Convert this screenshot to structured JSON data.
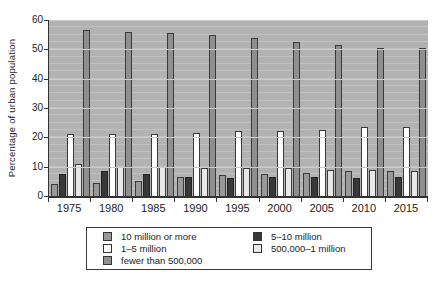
{
  "chart_data": {
    "type": "bar",
    "title": "",
    "xlabel": "",
    "ylabel": "Percentage of urban population",
    "ylim": [
      0,
      60
    ],
    "yticks": [
      0,
      10,
      20,
      30,
      40,
      50,
      60
    ],
    "grid": "horizontal, major every 10, faint minor stripes every 2.5",
    "plot_background": "#b2b2b2",
    "gridline_color": "#cbcbcb",
    "legend_position": "boxed, below chart, two columns",
    "categories": [
      "1975",
      "1980",
      "1985",
      "1990",
      "1995",
      "2000",
      "2005",
      "2010",
      "2015"
    ],
    "series": [
      {
        "name": "10 million or more",
        "color": "#999999",
        "border": "#3a3a3a",
        "values": [
          4,
          4.5,
          5,
          6.5,
          7,
          7.5,
          8,
          8.5,
          8.5
        ]
      },
      {
        "name": "5–10 million",
        "color": "#383838",
        "border": "#222222",
        "values": [
          7.5,
          8.5,
          7.5,
          6.5,
          6,
          6.5,
          6.5,
          6,
          6.5
        ]
      },
      {
        "name": "1–5 million",
        "color": "#ffffff",
        "border": "#3a3a3a",
        "values": [
          21,
          21,
          21,
          21.5,
          22,
          22,
          22.5,
          23.5,
          23.5
        ]
      },
      {
        "name": "500,000–1 million",
        "color": "#e8e8e8",
        "border": "#3a3a3a",
        "values": [
          11,
          10,
          10,
          9.5,
          9.5,
          9.5,
          9,
          9,
          8.5
        ]
      },
      {
        "name": "fewer than 500,000",
        "color": "#8f8f8f",
        "border": "#3a3a3a",
        "values": [
          56.5,
          56,
          55.5,
          55,
          54,
          52.5,
          51.5,
          50.5,
          50.5
        ]
      }
    ],
    "legend_grid_rows": [
      [
        0,
        1
      ],
      [
        2,
        3
      ],
      [
        4,
        null
      ]
    ]
  }
}
